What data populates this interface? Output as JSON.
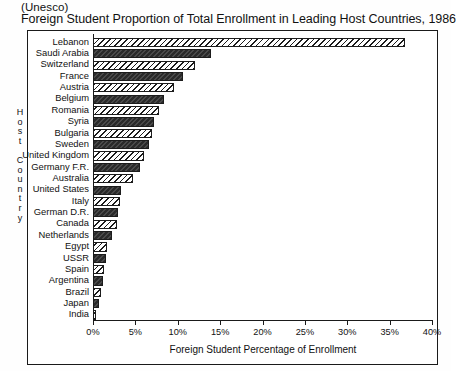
{
  "source": "(Unesco)",
  "title": "Foreign Student Proportion of Total Enrollment in Leading Host Countries, 1986",
  "axes": {
    "y_title_letters": [
      "H",
      "o",
      "s",
      "t",
      "",
      "C",
      "o",
      "u",
      "n",
      "t",
      "r",
      "y"
    ],
    "y_title": "Host Country",
    "x_title": "Foreign Student Percentage of Enrollment",
    "x_ticks": [
      "0%",
      "5%",
      "10%",
      "15%",
      "20%",
      "25%",
      "30%",
      "35%",
      "40%"
    ]
  },
  "chart_data": {
    "type": "bar",
    "orientation": "horizontal",
    "title": "Foreign Student Proportion of Total Enrollment in Leading Host Countries, 1986",
    "subtitle": "(Unesco)",
    "xlabel": "Foreign Student Percentage of Enrollment",
    "ylabel": "Host Country",
    "xlim": [
      0,
      40
    ],
    "xtick_values": [
      0,
      5,
      10,
      15,
      20,
      25,
      30,
      35,
      40
    ],
    "grid": false,
    "legend": "none",
    "units": "percent",
    "categories": [
      "Lebanon",
      "Saudi Arabia",
      "Switzerland",
      "France",
      "Austria",
      "Belgium",
      "Romania",
      "Syria",
      "Bulgaria",
      "Sweden",
      "United Kingdom",
      "Germany F.R.",
      "Australia",
      "United States",
      "Italy",
      "German D.R.",
      "Canada",
      "Netherlands",
      "Egypt",
      "USSR",
      "Spain",
      "Argentina",
      "Brazil",
      "Japan",
      "India"
    ],
    "values": [
      36.8,
      13.9,
      12.0,
      10.6,
      9.6,
      8.4,
      7.8,
      7.2,
      7.0,
      6.6,
      6.0,
      5.6,
      4.7,
      3.3,
      3.2,
      2.9,
      2.8,
      2.2,
      1.6,
      1.5,
      1.3,
      1.2,
      0.9,
      0.7,
      0.4
    ],
    "bar_fills": [
      "hatch",
      "solid",
      "hatch",
      "solid",
      "hatch",
      "solid",
      "hatch",
      "solid",
      "hatch",
      "solid",
      "hatch",
      "solid",
      "hatch",
      "solid",
      "hatch",
      "solid",
      "hatch",
      "solid",
      "hatch",
      "solid",
      "hatch",
      "solid",
      "hatch",
      "solid",
      "hatch"
    ]
  },
  "colors": {
    "ink": "#1a1a1a",
    "bar_solid": "#3a3a3a",
    "bar_hatch_bg": "#ffffff",
    "page_bg": "#ffffff"
  }
}
